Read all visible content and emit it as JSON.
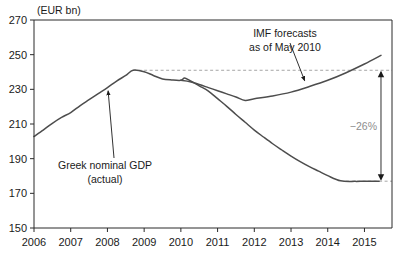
{
  "chart_data": {
    "type": "line",
    "title": "",
    "subtitle": "",
    "xlabel": "",
    "ylabel": "",
    "unit_label": "(EUR bn)",
    "xlim": [
      2006,
      2015.75
    ],
    "ylim": [
      150,
      270
    ],
    "ytick_step": 20,
    "grid": false,
    "legend_position": "inline-annotations",
    "x_tick_labels": [
      "2006",
      "2007",
      "2008",
      "2009",
      "2010",
      "2011",
      "2012",
      "2013",
      "2014",
      "2015"
    ],
    "x_tick_values": [
      2006,
      2007,
      2008,
      2009,
      2010,
      2011,
      2012,
      2013,
      2014,
      2015
    ],
    "y_tick_labels": [
      "270",
      "250",
      "230",
      "210",
      "190",
      "170",
      "150"
    ],
    "y_tick_values": [
      270,
      250,
      230,
      210,
      190,
      170,
      150
    ],
    "series": [
      {
        "name": "Greek nominal GDP (actual)",
        "color": "#4d4d4d",
        "x": [
          2006.0,
          2006.25,
          2006.5,
          2006.75,
          2007.0,
          2007.25,
          2007.5,
          2007.75,
          2008.0,
          2008.25,
          2008.5,
          2008.7,
          2009.0,
          2009.25,
          2009.5,
          2009.75,
          2010.0,
          2010.1,
          2010.25,
          2010.5,
          2010.75,
          2011.0,
          2011.25,
          2011.5,
          2011.75,
          2012.0,
          2012.25,
          2012.5,
          2012.75,
          2013.0,
          2013.25,
          2013.5,
          2013.75,
          2014.0,
          2014.35,
          2014.75,
          2015.0,
          2015.4
        ],
        "values": [
          202.8,
          206.5,
          210.4,
          213.8,
          216.6,
          220.5,
          224.0,
          227.5,
          231.0,
          234.8,
          238.0,
          241.0,
          240.2,
          238.0,
          236.0,
          235.4,
          235.2,
          236.5,
          235.0,
          232.0,
          229.0,
          224.6,
          220.2,
          215.5,
          211.0,
          206.5,
          202.5,
          198.6,
          195.0,
          191.5,
          188.3,
          185.4,
          182.8,
          180.2,
          177.2,
          176.9,
          177.0,
          177.0
        ]
      },
      {
        "name": "IMF forecasts as of May 2010",
        "color": "#4d4d4d",
        "x": [
          2010.0,
          2010.25,
          2010.5,
          2010.75,
          2011.0,
          2011.25,
          2011.5,
          2011.75,
          2012.0,
          2012.5,
          2013.0,
          2013.5,
          2014.0,
          2014.5,
          2015.0,
          2015.45
        ],
        "values": [
          235.2,
          234.4,
          232.8,
          231.0,
          229.2,
          227.4,
          225.6,
          223.6,
          224.6,
          226.2,
          228.4,
          231.6,
          235.2,
          239.6,
          244.6,
          249.6
        ]
      }
    ],
    "reference_line": {
      "name": "2008 peak level",
      "value": 241.0,
      "style": "dashed",
      "color": "#a6a6a6",
      "x_start": 2008.7,
      "x_end": 2015.75
    },
    "reference_line_low": {
      "name": "2015 actual level",
      "value": 177.0,
      "style": "dashed",
      "color": "#a6a6a6",
      "x_start": 2014.5,
      "x_end": 2015.75
    },
    "annotations": [
      {
        "id": "actual-label",
        "lines": [
          "Greek nominal GDP",
          "(actual)"
        ],
        "points_to": {
          "x": 2007.95,
          "y": 231.5
        }
      },
      {
        "id": "imf-label",
        "lines": [
          "IMF forecasts",
          "as of May 2010"
        ],
        "points_to": {
          "x": 2013.4,
          "y": 232.0
        }
      },
      {
        "id": "gap-label",
        "text": "−26%",
        "color": "#8d8d8d",
        "from_value": 241.0,
        "to_value": 177.0,
        "at_x": 2015.45
      }
    ]
  }
}
